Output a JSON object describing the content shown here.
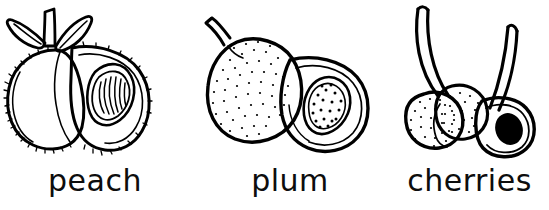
{
  "page": {
    "background_color": "#ffffff",
    "ink_color": "#000000",
    "style": "black and white line art / coloring book outline",
    "width": 549,
    "height": 210
  },
  "items": [
    {
      "id": "peach",
      "label": "peach",
      "icon_name": "peach-illustration",
      "description": "Whole peach with two leaves and short stem beside a halved peach showing a grooved pit",
      "parts": [
        "whole-peach-with-fuzzy-outline",
        "two-leaves",
        "stem",
        "halved-peach",
        "grooved-peach-pit"
      ],
      "texture": "fuzzy hairline spikes along outline",
      "pit_style": "ridged oval pit"
    },
    {
      "id": "plum",
      "label": "plum",
      "icon_name": "plum-illustration",
      "description": "Whole stippled plum with a curved stem beside a halved plum showing a speckled teardrop pit",
      "parts": [
        "whole-plum",
        "curved-stem",
        "halved-plum",
        "teardrop-plum-pit"
      ],
      "texture": "stippled dots across the skin",
      "pit_style": "pointed teardrop pit with dark speckles"
    },
    {
      "id": "cherries",
      "label": "cherries",
      "icon_name": "cherries-illustration",
      "description": "Two whole stippled cherries on long curved stems with one halved cherry showing a solid black pit",
      "parts": [
        "long-left-stem",
        "long-right-stem",
        "whole-cherry-front",
        "whole-cherry-back",
        "halved-cherry",
        "solid-black-cherry-pit"
      ],
      "texture": "stippled dots on whole cherries",
      "pit_style": "solid filled black oval pit"
    }
  ]
}
